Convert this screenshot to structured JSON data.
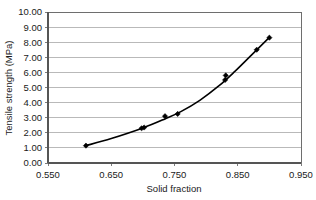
{
  "chart_data": {
    "type": "scatter",
    "title": "",
    "subtitle": "",
    "xlabel": "Solid fraction",
    "ylabel": "Tensile strength (MPa)",
    "xlim": [
      0.55,
      0.95
    ],
    "ylim": [
      0.0,
      10.0
    ],
    "xticks": [
      0.55,
      0.65,
      0.75,
      0.85,
      0.95
    ],
    "xtick_labels": [
      "0.550",
      "0.650",
      "0.750",
      "0.850",
      "0.950"
    ],
    "yticks": [
      0.0,
      1.0,
      2.0,
      3.0,
      4.0,
      5.0,
      6.0,
      7.0,
      8.0,
      9.0,
      10.0
    ],
    "ytick_labels": [
      "0.00",
      "1.00",
      "2.00",
      "3.00",
      "4.00",
      "5.00",
      "6.00",
      "7.00",
      "8.00",
      "9.00",
      "10.00"
    ],
    "grid": "horizontal",
    "grid_color": "#a8a8a8",
    "legend": "none",
    "marker": "diamond",
    "marker_color": "#000000",
    "line_color": "#000000",
    "has_trend_line": true,
    "trend_line_style": "smooth",
    "x": [
      0.61,
      0.698,
      0.702,
      0.735,
      0.755,
      0.83,
      0.831,
      0.88,
      0.9
    ],
    "y": [
      1.15,
      2.3,
      2.35,
      3.1,
      3.25,
      5.5,
      5.8,
      7.5,
      8.3
    ],
    "points": [
      {
        "x": 0.61,
        "y": 1.15
      },
      {
        "x": 0.698,
        "y": 2.3
      },
      {
        "x": 0.702,
        "y": 2.35
      },
      {
        "x": 0.735,
        "y": 3.1
      },
      {
        "x": 0.755,
        "y": 3.25
      },
      {
        "x": 0.83,
        "y": 5.5
      },
      {
        "x": 0.831,
        "y": 5.8
      },
      {
        "x": 0.88,
        "y": 7.5
      },
      {
        "x": 0.9,
        "y": 8.3
      }
    ],
    "trend_points": [
      {
        "x": 0.61,
        "y": 1.15
      },
      {
        "x": 0.65,
        "y": 1.62
      },
      {
        "x": 0.7,
        "y": 2.32
      },
      {
        "x": 0.735,
        "y": 2.92
      },
      {
        "x": 0.76,
        "y": 3.4
      },
      {
        "x": 0.79,
        "y": 4.15
      },
      {
        "x": 0.82,
        "y": 5.1
      },
      {
        "x": 0.845,
        "y": 6.05
      },
      {
        "x": 0.87,
        "y": 7.08
      },
      {
        "x": 0.9,
        "y": 8.32
      }
    ]
  },
  "axes": {
    "frame_color": "#6e6e6e",
    "background": "#ffffff"
  }
}
